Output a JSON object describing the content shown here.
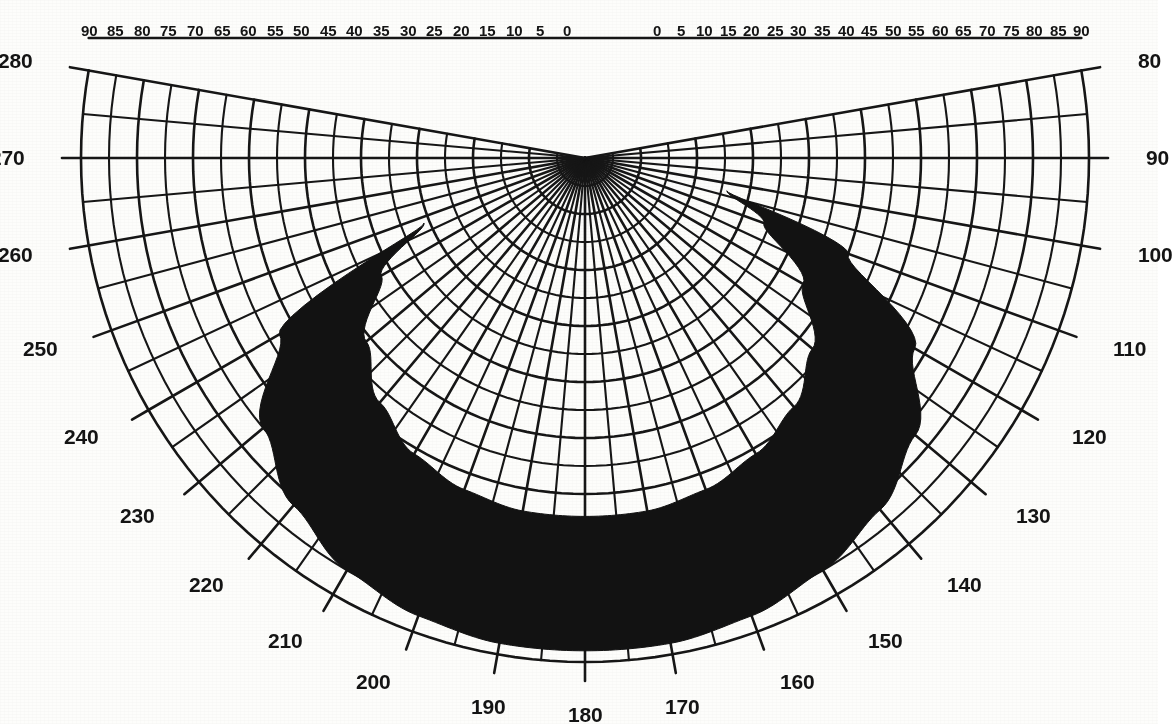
{
  "chart_data": {
    "type": "polar",
    "title": "",
    "subtitle": "",
    "xlabel": "",
    "ylabel": "",
    "projection": "equidistant-polar-half",
    "grid": true,
    "legend": false,
    "center_px": [
      585,
      158
    ],
    "outer_radius_px": 504,
    "altitude_axis": {
      "label": "",
      "units": "degrees",
      "range": [
        0,
        90
      ],
      "step": 5,
      "zero_at": "zenith-center",
      "ticks_left": [
        "90",
        "85",
        "80",
        "75",
        "70",
        "65",
        "60",
        "55",
        "50",
        "45",
        "40",
        "35",
        "30",
        "25",
        "20",
        "15",
        "10",
        "5",
        "0"
      ],
      "ticks_right": [
        "0",
        "5",
        "10",
        "15",
        "20",
        "25",
        "30",
        "35",
        "40",
        "45",
        "50",
        "55",
        "60",
        "65",
        "70",
        "75",
        "80",
        "85",
        "90"
      ],
      "minor_ring_step": 5,
      "major_ring_step": 10
    },
    "azimuth_axis": {
      "label": "",
      "units": "degrees",
      "range": [
        80,
        280
      ],
      "step": 10,
      "ticks": [
        "280",
        "270",
        "260",
        "250",
        "240",
        "230",
        "220",
        "210",
        "200",
        "190",
        "180",
        "170",
        "160",
        "150",
        "140",
        "130",
        "120",
        "110",
        "100",
        "90",
        "80"
      ],
      "ticks_left": [
        "280",
        "270",
        "260",
        "250",
        "240",
        "230",
        "220",
        "210",
        "200"
      ],
      "ticks_bottom": [
        "190",
        "180",
        "170"
      ],
      "ticks_right": [
        "160",
        "150",
        "140",
        "130",
        "120",
        "110",
        "100",
        "90",
        "80"
      ],
      "radial_line_step": 5
    },
    "series": [
      {
        "name": "shading-mask",
        "type": "filled-region",
        "color": "#121212",
        "description": "Crescent / annulus-sector obstruction mask",
        "inner_boundary": {
          "comment": "inner edge of the crescent, azimuth(deg) -> altitude(deg)",
          "azimuth": [
            103,
            110,
            120,
            130,
            140,
            150,
            160,
            170,
            180,
            190,
            200,
            210,
            220,
            230,
            240,
            248
          ],
          "altitude": [
            64,
            56,
            45,
            37,
            32,
            29,
            27,
            26,
            26,
            26,
            27,
            29,
            33,
            39,
            48,
            59
          ]
        },
        "outer_boundary": {
          "comment": "outer edge of the crescent, azimuth(deg) -> altitude(deg)",
          "azimuth": [
            103,
            110,
            120,
            130,
            140,
            150,
            160,
            170,
            180,
            190,
            200,
            210,
            220,
            230,
            240,
            248
          ],
          "altitude": [
            64,
            40,
            22,
            13,
            8,
            5,
            3,
            2,
            2,
            2,
            3,
            5,
            9,
            15,
            27,
            59
          ]
        },
        "tip_left_azimuth": 248,
        "tip_left_altitude": 59,
        "tip_right_azimuth": 103,
        "tip_right_altitude": 64
      }
    ],
    "colors": {
      "background": "#fdfdfb",
      "grid": "#161616",
      "mask": "#121212",
      "label": "#141414"
    }
  },
  "labels": {
    "altitude_left": [
      {
        "text": "90",
        "alt": 90
      },
      {
        "text": "85",
        "alt": 85
      },
      {
        "text": "80",
        "alt": 80
      },
      {
        "text": "75",
        "alt": 75
      },
      {
        "text": "70",
        "alt": 70
      },
      {
        "text": "65",
        "alt": 65
      },
      {
        "text": "60",
        "alt": 60
      },
      {
        "text": "55",
        "alt": 55
      },
      {
        "text": "50",
        "alt": 50
      },
      {
        "text": "45",
        "alt": 45
      },
      {
        "text": "40",
        "alt": 40
      },
      {
        "text": "35",
        "alt": 35
      },
      {
        "text": "30",
        "alt": 30
      },
      {
        "text": "25",
        "alt": 25
      },
      {
        "text": "20",
        "alt": 20
      },
      {
        "text": "15",
        "alt": 15
      },
      {
        "text": "10",
        "alt": 10
      },
      {
        "text": "5",
        "alt": 5
      },
      {
        "text": "0",
        "alt": 0
      }
    ],
    "altitude_right": [
      {
        "text": "0",
        "alt": 0
      },
      {
        "text": "5",
        "alt": 5
      },
      {
        "text": "10",
        "alt": 10
      },
      {
        "text": "15",
        "alt": 15
      },
      {
        "text": "20",
        "alt": 20
      },
      {
        "text": "25",
        "alt": 25
      },
      {
        "text": "30",
        "alt": 30
      },
      {
        "text": "35",
        "alt": 35
      },
      {
        "text": "40",
        "alt": 40
      },
      {
        "text": "45",
        "alt": 45
      },
      {
        "text": "50",
        "alt": 50
      },
      {
        "text": "55",
        "alt": 55
      },
      {
        "text": "60",
        "alt": 60
      },
      {
        "text": "65",
        "alt": 65
      },
      {
        "text": "70",
        "alt": 70
      },
      {
        "text": "75",
        "alt": 75
      },
      {
        "text": "80",
        "alt": 80
      },
      {
        "text": "85",
        "alt": 85
      },
      {
        "text": "90",
        "alt": 90
      }
    ],
    "azimuth": [
      {
        "text": "280",
        "az": 280
      },
      {
        "text": "270",
        "az": 270
      },
      {
        "text": "260",
        "az": 260
      },
      {
        "text": "250",
        "az": 250
      },
      {
        "text": "240",
        "az": 240
      },
      {
        "text": "230",
        "az": 230
      },
      {
        "text": "220",
        "az": 220
      },
      {
        "text": "210",
        "az": 210
      },
      {
        "text": "200",
        "az": 200
      },
      {
        "text": "190",
        "az": 190
      },
      {
        "text": "180",
        "az": 180
      },
      {
        "text": "170",
        "az": 170
      },
      {
        "text": "160",
        "az": 160
      },
      {
        "text": "150",
        "az": 150
      },
      {
        "text": "140",
        "az": 140
      },
      {
        "text": "130",
        "az": 130
      },
      {
        "text": "120",
        "az": 120
      },
      {
        "text": "110",
        "az": 110
      },
      {
        "text": "100",
        "az": 100
      },
      {
        "text": "90",
        "az": 90
      },
      {
        "text": "80",
        "az": 80
      }
    ]
  }
}
